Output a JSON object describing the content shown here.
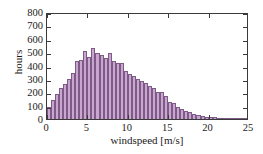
{
  "chart_data": {
    "type": "bar",
    "title": "",
    "subtitle": "",
    "xlabel": "windspeed [m/s]",
    "ylabel": "hours",
    "xlim": [
      0,
      25
    ],
    "ylim": [
      0,
      800
    ],
    "xticks": [
      0,
      5,
      10,
      15,
      20,
      25
    ],
    "yticks": [
      0,
      100,
      200,
      300,
      400,
      500,
      600,
      700,
      800
    ],
    "xtick_labels": [
      "0",
      "5",
      "10",
      "15",
      "20",
      "25"
    ],
    "ytick_labels": [
      "0",
      "100",
      "200",
      "300",
      "400",
      "500",
      "600",
      "700",
      "800"
    ],
    "grid": false,
    "legend": null,
    "bin_width": 0.5,
    "bar_fill_color": "#c9a6ce",
    "bar_edge_color": "#7e5a88",
    "axis_color": "#3a3a3a",
    "background_color": "#ffffff",
    "categories": [
      "0.25",
      "0.75",
      "1.25",
      "1.75",
      "2.25",
      "2.75",
      "3.25",
      "3.75",
      "4.25",
      "4.75",
      "5.25",
      "5.75",
      "6.25",
      "6.75",
      "7.25",
      "7.75",
      "8.25",
      "8.75",
      "9.25",
      "9.75",
      "10.25",
      "10.75",
      "11.25",
      "11.75",
      "12.25",
      "12.75",
      "13.25",
      "13.75",
      "14.25",
      "14.75",
      "15.25",
      "15.75",
      "16.25",
      "16.75",
      "17.25",
      "17.75",
      "18.25",
      "18.75",
      "19.25",
      "19.75",
      "20.25",
      "20.75",
      "21.25",
      "21.75",
      "22.25",
      "22.75",
      "23.25",
      "23.75",
      "24.25",
      "24.75"
    ],
    "values": [
      90,
      145,
      190,
      235,
      265,
      300,
      345,
      435,
      440,
      510,
      465,
      530,
      495,
      475,
      455,
      490,
      435,
      420,
      420,
      360,
      340,
      325,
      300,
      285,
      270,
      250,
      235,
      205,
      200,
      170,
      130,
      120,
      90,
      75,
      60,
      50,
      35,
      30,
      22,
      18,
      14,
      12,
      9,
      7,
      5,
      4,
      3,
      2,
      2,
      1
    ]
  }
}
